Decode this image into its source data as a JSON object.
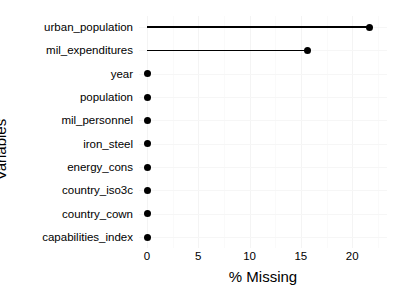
{
  "chart_data": {
    "type": "bar",
    "subtype": "lollipop-dot-plot",
    "title": "",
    "xlabel": "% Missing",
    "ylabel": "Variables",
    "orientation": "horizontal",
    "categories": [
      "urban_population",
      "mil_expenditures",
      "year",
      "population",
      "mil_personnel",
      "iron_steel",
      "energy_cons",
      "country_iso3c",
      "country_cown",
      "capabilities_index"
    ],
    "values": [
      21.7,
      15.6,
      0,
      0,
      0,
      0,
      0,
      0,
      0,
      0
    ],
    "xlim": [
      0,
      23.2
    ],
    "xticks": [
      0,
      5,
      10,
      15,
      20
    ],
    "xticklabels": [
      "0",
      "5",
      "10",
      "15",
      "20"
    ],
    "minor_xticks": [
      2.5,
      7.5,
      12.5,
      17.5,
      22.5
    ],
    "grid": true,
    "legend": false,
    "legend_position": "none",
    "marker": "filled-circle",
    "series_color": "#000000",
    "panel_background": "#ffffff",
    "gridline_color": "#f4f4f4"
  },
  "axes": {
    "y_title": "Variables",
    "x_title": "% Missing"
  }
}
